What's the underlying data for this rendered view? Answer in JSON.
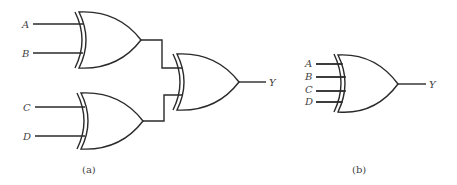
{
  "figure_a": {
    "caption": "(a)",
    "inputs": [
      "A",
      "B",
      "C",
      "D"
    ],
    "output": "Y",
    "gates": [
      {
        "id": "xor1",
        "type": "XOR",
        "inputs": [
          "A",
          "B"
        ]
      },
      {
        "id": "xor2",
        "type": "XOR",
        "inputs": [
          "C",
          "D"
        ]
      },
      {
        "id": "xor3",
        "type": "XOR",
        "inputs": [
          "xor1",
          "xor2"
        ],
        "output": "Y"
      }
    ]
  },
  "figure_b": {
    "caption": "(b)",
    "inputs": [
      "A",
      "B",
      "C",
      "D"
    ],
    "output": "Y",
    "gates": [
      {
        "id": "xor4",
        "type": "XOR",
        "inputs": [
          "A",
          "B",
          "C",
          "D"
        ],
        "output": "Y"
      }
    ]
  }
}
